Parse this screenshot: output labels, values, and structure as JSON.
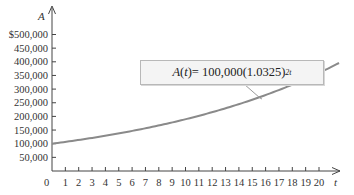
{
  "chart_data": {
    "type": "line",
    "title": "",
    "xlabel": "t",
    "ylabel": "A",
    "xlim": [
      0,
      21.5
    ],
    "ylim": [
      0,
      500000
    ],
    "x_ticks": [
      1,
      2,
      3,
      4,
      5,
      6,
      7,
      8,
      9,
      10,
      11,
      12,
      13,
      14,
      15,
      16,
      17,
      18,
      19,
      20
    ],
    "x_tick_labels": [
      "0",
      "1",
      "2",
      "3",
      "4",
      "5",
      "6",
      "7",
      "8",
      "9",
      "10",
      "11",
      "12",
      "13",
      "14",
      "15",
      "16",
      "17",
      "18",
      "19",
      "20"
    ],
    "y_ticks": [
      50000,
      100000,
      150000,
      200000,
      250000,
      300000,
      350000,
      400000,
      450000,
      500000
    ],
    "y_tick_labels": [
      "50,000",
      "100,000",
      "150,000",
      "200,000",
      "250,000",
      "300,000",
      "350,000",
      "400,000",
      "450,000",
      "$500,000"
    ],
    "grid": false,
    "annotation": "A(t) = 100,000(1.0325)^{2t}",
    "series": [
      {
        "name": "A(t) = 100,000(1.0325)^(2t)",
        "color": "#8a8a8a",
        "x": [
          0,
          2,
          4,
          6,
          8,
          10,
          12,
          14,
          16,
          18,
          20,
          21.5
        ],
        "values": [
          100000,
          113700,
          129270,
          146970,
          167100,
          189990,
          216000,
          245580,
          279210,
          317450,
          360920,
          396700
        ]
      }
    ]
  },
  "labels": {
    "y_var": "A",
    "x_var": "t",
    "origin": "0",
    "formula_lhs": "A",
    "formula_arg": "t",
    "formula_rhs": " = 100,000(1.0325)",
    "formula_exp": "2t"
  }
}
